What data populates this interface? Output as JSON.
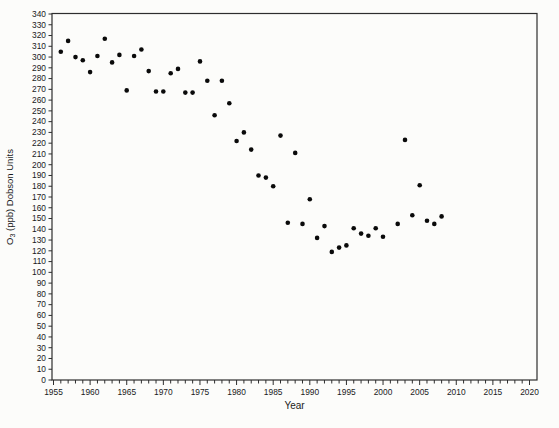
{
  "chart_data": {
    "type": "scatter",
    "title": "",
    "xlabel": "Year",
    "ylabel": "O3 (ppb) Dobson Units",
    "ylabel_rich": {
      "pre": "O",
      "sub": "3",
      "post": " (ppb) Dobson Units"
    },
    "xlim": [
      1955,
      2020
    ],
    "ylim": [
      0,
      340
    ],
    "x_major_tick_step": 5,
    "x_minor_tick_step": 1,
    "y_tick_step": 10,
    "x_tick_labels": [
      "1955",
      "1960",
      "1965",
      "1970",
      "1975",
      "1980",
      "1985",
      "1990",
      "1995",
      "2000",
      "2005",
      "2010",
      "2015",
      "2020"
    ],
    "y_tick_labels": [
      0,
      10,
      20,
      30,
      40,
      50,
      60,
      70,
      80,
      90,
      100,
      110,
      120,
      130,
      140,
      150,
      160,
      170,
      180,
      190,
      200,
      210,
      220,
      230,
      240,
      250,
      260,
      270,
      280,
      290,
      300,
      310,
      320,
      330,
      340
    ],
    "grid": "off",
    "legend": "none",
    "marker": {
      "shape": "circle",
      "color": "#0a0a0a",
      "diameter_px": 5
    },
    "axis_color": "#2e2e2e",
    "background_color": "#fcfcfa",
    "points": [
      [
        1956,
        305
      ],
      [
        1957,
        315
      ],
      [
        1958,
        300
      ],
      [
        1959,
        297
      ],
      [
        1960,
        286
      ],
      [
        1961,
        301
      ],
      [
        1962,
        317
      ],
      [
        1963,
        295
      ],
      [
        1964,
        302
      ],
      [
        1965,
        269
      ],
      [
        1966,
        301
      ],
      [
        1967,
        307
      ],
      [
        1968,
        287
      ],
      [
        1969,
        268
      ],
      [
        1970,
        268
      ],
      [
        1971,
        285
      ],
      [
        1972,
        289
      ],
      [
        1973,
        267
      ],
      [
        1974,
        267
      ],
      [
        1975,
        296
      ],
      [
        1976,
        278
      ],
      [
        1977,
        246
      ],
      [
        1978,
        278
      ],
      [
        1979,
        257
      ],
      [
        1980,
        222
      ],
      [
        1981,
        230
      ],
      [
        1982,
        214
      ],
      [
        1983,
        190
      ],
      [
        1984,
        188
      ],
      [
        1985,
        180
      ],
      [
        1986,
        227
      ],
      [
        1987,
        146
      ],
      [
        1988,
        211
      ],
      [
        1989,
        145
      ],
      [
        1990,
        168
      ],
      [
        1991,
        132
      ],
      [
        1992,
        143
      ],
      [
        1993,
        119
      ],
      [
        1994,
        123
      ],
      [
        1995,
        125
      ],
      [
        1996,
        141
      ],
      [
        1997,
        136
      ],
      [
        1998,
        134
      ],
      [
        1999,
        141
      ],
      [
        2000,
        133
      ],
      [
        2002,
        145
      ],
      [
        2003,
        223
      ],
      [
        2004,
        153
      ],
      [
        2005,
        181
      ],
      [
        2006,
        148
      ],
      [
        2007,
        145
      ],
      [
        2008,
        152
      ]
    ]
  }
}
